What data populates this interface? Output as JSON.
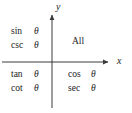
{
  "figure": {
    "background_color": "#ffffff",
    "line_color": "#3a3a3a",
    "text_color": "#1a1a1a"
  },
  "axes": {
    "x_label": "x",
    "y_label": "y",
    "origin": {
      "x": 52,
      "y": 62
    },
    "x_start": {
      "x": 2,
      "y": 62
    },
    "x_end": {
      "x": 112,
      "y": 62
    },
    "y_start": {
      "x": 52,
      "y": 108
    },
    "y_end": {
      "x": 52,
      "y": 11
    },
    "x_arrow": "arrow-right",
    "y_arrow": "arrow-up"
  },
  "quadrants": [
    {
      "id": "quadrant-1",
      "name": "Quadrant I",
      "layout": "single",
      "text": "All",
      "functions": []
    },
    {
      "id": "quadrant-2",
      "name": "Quadrant II",
      "layout": "list",
      "text": "",
      "functions": [
        {
          "name": "sin",
          "arg": "θ"
        },
        {
          "name": "csc",
          "arg": "θ"
        }
      ]
    },
    {
      "id": "quadrant-3",
      "name": "Quadrant III",
      "layout": "list",
      "text": "",
      "functions": [
        {
          "name": "tan",
          "arg": "θ"
        },
        {
          "name": "cot",
          "arg": "θ"
        }
      ]
    },
    {
      "id": "quadrant-4",
      "name": "Quadrant IV",
      "layout": "list",
      "text": "",
      "functions": [
        {
          "name": "cos",
          "arg": "θ"
        },
        {
          "name": "sec",
          "arg": "θ"
        }
      ]
    }
  ]
}
